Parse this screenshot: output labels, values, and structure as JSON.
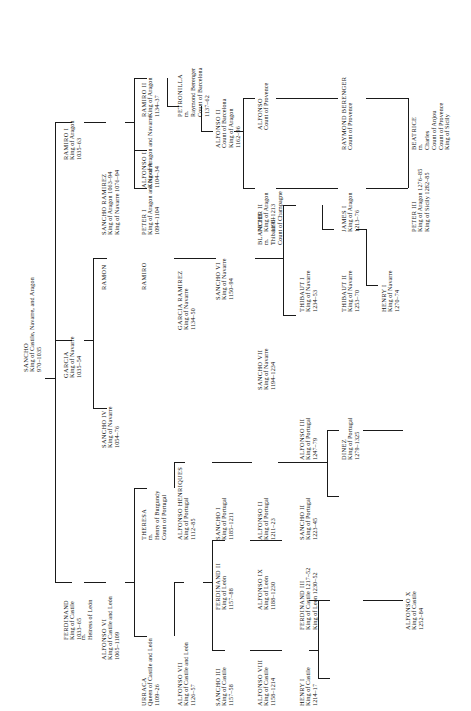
{
  "meta": {
    "orientation": "rotated-90-ccw",
    "line_color": "#1a1a1a"
  },
  "people": {
    "sancho_great": {
      "name": "SANCHO",
      "title": "King of Castile, Navarre, and Aragon",
      "years": "970–1035"
    },
    "garcia_navarre": {
      "name": "GARCIA",
      "title": "King of Navarre",
      "years": "1035–54"
    },
    "ramiro_i_aragon": {
      "name": "RAMIRO I",
      "title": "King of Aragon",
      "years": "1035–63"
    },
    "ferdinand_i": {
      "name": "FERDINAND",
      "title": "King of Castile",
      "years": "1033–65",
      "marriage_mark": "m.",
      "spouse": "Heiress of León"
    },
    "sancho_iv_navarre": {
      "name": "SANCHO IV",
      "title": "King of Navarre",
      "years": "1054–76"
    },
    "ramon": {
      "name": "RAMON",
      "title": "",
      "years": ""
    },
    "ramiro": {
      "name": "RAMIRO",
      "title": "",
      "years": ""
    },
    "sancho_ramirez": {
      "name": "SANCHO RAMIREZ",
      "title": "King of Aragon 1063–94",
      "title2": "King of Navarre 1076–94"
    },
    "peter_i": {
      "name": "PETER I",
      "title": "King of Aragon and Navarre",
      "years": "1094–1104"
    },
    "alfonso_i": {
      "name": "ALFONSO I",
      "title": "King of Aragon and Navarre",
      "years": "1104–34"
    },
    "ramiro_ii": {
      "name": "RAMIRO II",
      "title": "King of Aragon",
      "years": "1134–37"
    },
    "alfonso_vi": {
      "name": "ALFONSO VI",
      "title": "King of Castile and León",
      "years": "1065–1109"
    },
    "garcia_ramirez": {
      "name": "GARCIA RAMIREZ",
      "title": "King of Navarre",
      "years": "1134–50"
    },
    "petronilla": {
      "name": "PETRONILLA",
      "marriage_mark": "m.",
      "spouse": "Raymond Berenger",
      "spouse_title": "Count of Barcelona",
      "years": "1137–62"
    },
    "urraca": {
      "name": "URRACA",
      "title": "Queen of Castile and León",
      "years": "1109–26"
    },
    "theresa": {
      "name": "THERESA",
      "marriage_mark": "m.",
      "spouse": "Henry of Burgundy",
      "spouse_title": "Count of Portugal"
    },
    "sancho_vi_navarre": {
      "name": "SANCHO VI",
      "title": "King of Navarre",
      "years": "1150–94"
    },
    "alfonso_ii_barcelona": {
      "name": "ALFONSO II",
      "title": "Count of Barcelona",
      "title2": "King of Aragon",
      "years": "1162–96"
    },
    "alfonso_vii": {
      "name": "ALFONSO VII",
      "title": "King of Castile and León",
      "years": "1126–57"
    },
    "alfonso_henriques": {
      "name": "ALFONSO HENRIQUES",
      "title": "King of Portugal",
      "years": "1112–85"
    },
    "sancho_iii_castile": {
      "name": "SANCHO III",
      "title": "King of Castile",
      "years": "1157–58"
    },
    "ferdinand_ii_leon": {
      "name": "FERDINAND II",
      "title": "King of León",
      "years": "1157–88"
    },
    "sancho_i_portugal": {
      "name": "SANCHO I",
      "title": "King of Portugal",
      "years": "1185–1211"
    },
    "sancho_vii_navarre": {
      "name": "SANCHO VII",
      "title": "King of Navarre",
      "years": "1194–1234"
    },
    "blanche": {
      "name": "BLANCHE",
      "marriage_mark": "m.",
      "spouse": "Thibaut III",
      "spouse_title": "Count of Champagne"
    },
    "peter_ii_aragon": {
      "name": "PETER II",
      "title": "King of Aragon",
      "years": "1196–1213"
    },
    "alfonso_provence": {
      "name": "ALFONSO",
      "title": "Count of Provence"
    },
    "alfonso_viii_castile": {
      "name": "ALFONSO VIII",
      "title": "King of Castile",
      "years": "1158–1214"
    },
    "alfonso_ix_leon": {
      "name": "ALFONSO IX",
      "title": "King of León",
      "years": "1188–1230"
    },
    "alfonso_ii_portugal": {
      "name": "ALFONSO II",
      "title": "King of Portugal",
      "years": "1211–23"
    },
    "thibaut_i_navarre": {
      "name": "THIBAUT I",
      "title": "King of Navarre",
      "years": "1234–53"
    },
    "james_i_aragon": {
      "name": "JAMES I",
      "title": "King of Aragon",
      "years": "1213–76"
    },
    "raymond_berenger": {
      "name": "RAYMOND BERENGER",
      "title": "Count of Provence"
    },
    "henry_i_castile": {
      "name": "HENRY I",
      "title": "King of Castile",
      "years": "1214–17"
    },
    "ferdinand_iii": {
      "name": "FERDINAND III",
      "title": "King of Castile 1217–52",
      "title2": "King of León 1230–52"
    },
    "sancho_ii_portugal": {
      "name": "SANCHO II",
      "title": "King of Portugal",
      "years": "1223–45"
    },
    "alfonso_iii_portugal": {
      "name": "ALFONSO III",
      "title": "King of Portugal",
      "years": "1247–79"
    },
    "thibaut_ii_navarre": {
      "name": "THIBAUT II",
      "title": "King of Navarre",
      "years": "1253–70"
    },
    "henry_i_navarre": {
      "name": "HENRY I",
      "title": "King of Navarre",
      "years": "1270–74"
    },
    "peter_iii_aragon": {
      "name": "PETER III",
      "title": "King of Aragon 1276–85",
      "title2": "King of Sicily 1282–85"
    },
    "beatrice": {
      "name": "BEATRICE",
      "marriage_mark": "m.",
      "spouse": "Charles",
      "spouse_title": "Count of Anjou",
      "spouse_title2": "Count of Provence",
      "spouse_title3": "King of Sicily"
    },
    "alfonso_x": {
      "name": "ALFONSO X",
      "title": "King of Castile",
      "years": "1252–84"
    },
    "denez": {
      "name": "DINEZ",
      "title": "King of Portugal",
      "years": "1279–1325"
    }
  }
}
